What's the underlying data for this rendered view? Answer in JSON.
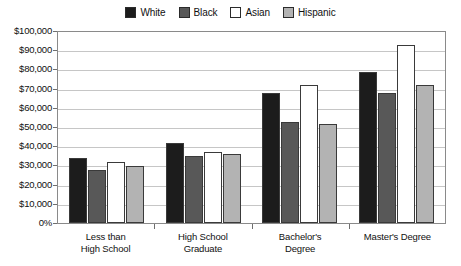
{
  "chart_data": {
    "type": "bar",
    "title": "",
    "subtitle": "",
    "xlabel": "",
    "ylabel": "",
    "ylim": [
      0,
      100000
    ],
    "grid": true,
    "legend_position": "top-center",
    "categories": [
      "Less than High School",
      "High School Graduate",
      "Bachelor's Degree",
      "Master's Degree"
    ],
    "category_lines": [
      [
        "Less than",
        "High School"
      ],
      [
        "High School",
        "Graduate"
      ],
      [
        "Bachelor's",
        "Degree"
      ],
      [
        "Master's Degree"
      ]
    ],
    "ytick_labels": [
      "$100,000",
      "$90,000",
      "$80,000",
      "$70,000",
      "$60,000",
      "$50,000",
      "$40,000",
      "$30,000",
      "$20,000",
      "$10,000",
      "0%"
    ],
    "ytick_values": [
      100000,
      90000,
      80000,
      70000,
      60000,
      50000,
      40000,
      30000,
      20000,
      10000,
      0
    ],
    "series": [
      {
        "name": "White",
        "color": "#1c1c1c",
        "values": [
          34000,
          42000,
          68000,
          79000
        ]
      },
      {
        "name": "Black",
        "color": "#585858",
        "values": [
          28000,
          35000,
          53000,
          68000
        ]
      },
      {
        "name": "Asian",
        "color": "#ffffff",
        "values": [
          32000,
          37000,
          72000,
          93000
        ]
      },
      {
        "name": "Hispanic",
        "color": "#b3b3b3",
        "values": [
          30000,
          36000,
          52000,
          72000
        ]
      }
    ]
  },
  "legend": {
    "items": [
      {
        "label": "White",
        "color": "#1c1c1c"
      },
      {
        "label": "Black",
        "color": "#585858"
      },
      {
        "label": "Asian",
        "color": "#ffffff"
      },
      {
        "label": "Hispanic",
        "color": "#b3b3b3"
      }
    ]
  },
  "colors": {
    "frame": "#8a8a8a",
    "gridline": "#c6c6c6",
    "bar_outline": "#3a3a3a",
    "text": "#111111",
    "background": "#ffffff"
  }
}
